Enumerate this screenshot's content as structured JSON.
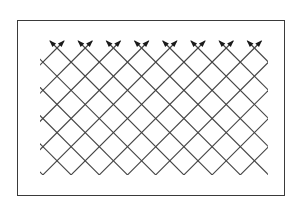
{
  "diagram": {
    "type": "diagonal-lattice-with-arrows",
    "frame": {
      "x": 17,
      "y": 20,
      "width": 268,
      "height": 176
    },
    "lattice": {
      "origin_x": 57,
      "origin_y": 48,
      "spacing": 28.2,
      "clip": {
        "x1": 40,
        "y1": 48,
        "x2": 268,
        "y2": 175
      },
      "arrow_pairs": 8,
      "line_color": "#444444",
      "arrow_color": "#1a1a1a"
    }
  }
}
